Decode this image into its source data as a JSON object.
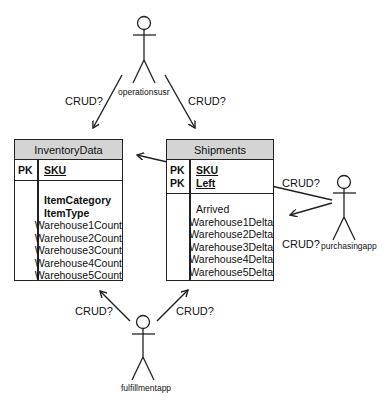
{
  "actors": {
    "operations": {
      "name": "operationsusr"
    },
    "purchasing": {
      "name": "purchasingapp"
    },
    "fulfillment": {
      "name": "fulfillmentapp"
    }
  },
  "edge_labels": {
    "ops_to_inventory": "CRUD?",
    "ops_to_shipments": "CRUD?",
    "purchasing_to_inventory": "CRUD?",
    "purchasing_to_shipments": "CRUD?",
    "fulfillment_to_inventory": "CRUD?",
    "fulfillment_to_shipments": "CRUD?"
  },
  "entities": {
    "inventory": {
      "title": "InventoryData",
      "primary_keys": [
        {
          "tag": "PK",
          "name": "SKU"
        }
      ],
      "attributes": [
        {
          "name": "ItemCategory",
          "bold": true
        },
        {
          "name": "ItemType",
          "bold": true
        },
        {
          "name": "Warehouse1Count"
        },
        {
          "name": "Warehouse2Count"
        },
        {
          "name": "Warehouse3Count"
        },
        {
          "name": "Warehouse4Count"
        },
        {
          "name": "Warehouse5Count"
        }
      ]
    },
    "shipments": {
      "title": "Shipments",
      "primary_keys": [
        {
          "tag": "PK",
          "name": "SKU"
        },
        {
          "tag": "PK",
          "name": "Left"
        }
      ],
      "attributes": [
        {
          "name": "Arrived"
        },
        {
          "name": "Warehouse1Delta"
        },
        {
          "name": "Warehouse2Delta"
        },
        {
          "name": "Warehouse3Delta"
        },
        {
          "name": "Warehouse4Delta"
        },
        {
          "name": "Warehouse5Delta"
        }
      ]
    }
  },
  "colors": {
    "header_fill": "#d4d4d4",
    "stroke": "#222222"
  }
}
